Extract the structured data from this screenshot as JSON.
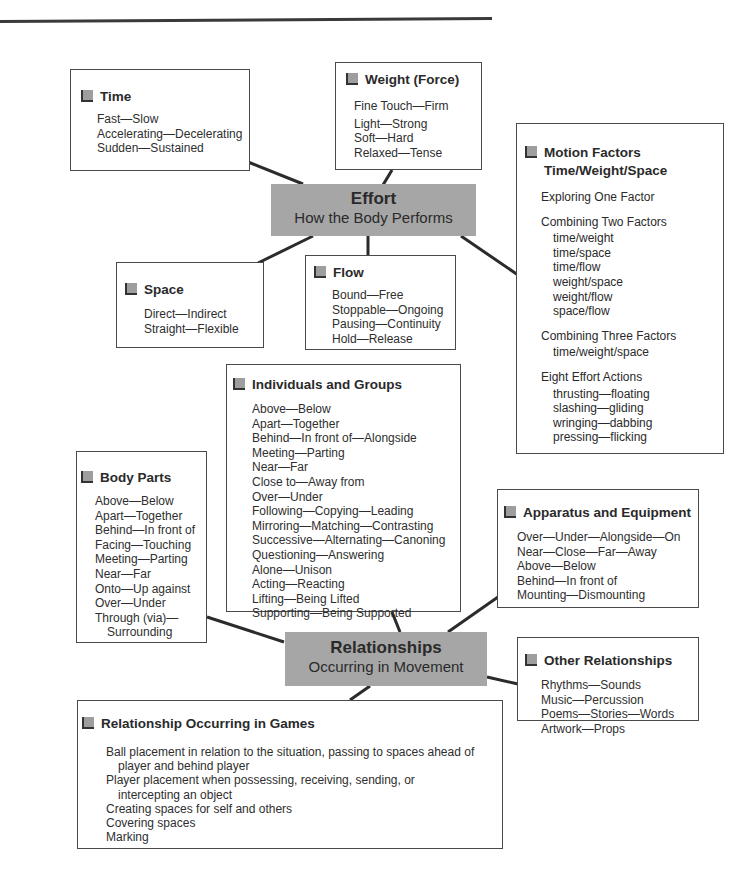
{
  "effort_hub": {
    "title": "Effort",
    "subtitle": "How the Body Performs"
  },
  "relationships_hub": {
    "title": "Relationships",
    "subtitle": "Occurring in Movement"
  },
  "time": {
    "title": "Time",
    "items": [
      "Fast—Slow",
      "Accelerating—Decelerating",
      "Sudden—Sustained"
    ]
  },
  "weight": {
    "title": "Weight (Force)",
    "items": [
      "Fine Touch—Firm",
      "Light—Strong",
      "Soft—Hard",
      "Relaxed—Tense"
    ]
  },
  "space": {
    "title": "Space",
    "items": [
      "Direct—Indirect",
      "Straight—Flexible"
    ]
  },
  "flow": {
    "title": "Flow",
    "items": [
      "Bound—Free",
      "Stoppable—Ongoing",
      "Pausing—Continuity",
      "Hold—Release"
    ]
  },
  "motion_factors": {
    "title_line1": "Motion Factors",
    "title_line2": "Time/Weight/Space",
    "groups": [
      {
        "heading": "Exploring One Factor",
        "items": []
      },
      {
        "heading": "Combining Two Factors",
        "items": [
          "time/weight",
          "time/space",
          "time/flow",
          "weight/space",
          "weight/flow",
          "space/flow"
        ]
      },
      {
        "heading": "Combining Three Factors",
        "items": [
          "time/weight/space"
        ]
      },
      {
        "heading": "Eight Effort Actions",
        "items": [
          "thrusting—floating",
          "slashing—gliding",
          "wringing—dabbing",
          "pressing—flicking"
        ]
      }
    ]
  },
  "individuals_groups": {
    "title": "Individuals and Groups",
    "items": [
      "Above—Below",
      "Apart—Together",
      "Behind—In front of—Alongside",
      "Meeting—Parting",
      "Near—Far",
      "Close to—Away from",
      "Over—Under",
      "Following—Copying—Leading",
      "Mirroring—Matching—Contrasting",
      "Successive—Alternating—Canoning",
      "Questioning—Answering",
      "Alone—Unison",
      "Acting—Reacting",
      "Lifting—Being Lifted",
      "Supporting—Being Supported"
    ]
  },
  "body_parts": {
    "title": "Body Parts",
    "items": [
      "Above—Below",
      "Apart—Together",
      "Behind—In front of",
      "Facing—Touching",
      "Meeting—Parting",
      "Near—Far",
      "Onto—Up against",
      "Over—Under",
      "Through (via)—"
    ],
    "continuation": "Surrounding"
  },
  "apparatus": {
    "title": "Apparatus and Equipment",
    "items": [
      "Over—Under—Alongside—On",
      "Near—Close—Far—Away",
      "Above—Below",
      "Behind—In front of",
      "Mounting—Dismounting"
    ]
  },
  "other_relationships": {
    "title": "Other Relationships",
    "items": [
      "Rhythms—Sounds",
      "Music—Percussion",
      "Poems—Stories—Words",
      "Artwork—Props"
    ]
  },
  "games": {
    "title": "Relationship Occurring in Games",
    "entries": [
      {
        "line": "Ball placement in relation to the situation, passing to spaces ahead of",
        "cont": "player and behind player"
      },
      {
        "line": "Player placement when possessing, receiving, sending, or",
        "cont": "intercepting an object"
      },
      {
        "line": "Creating spaces for self and others",
        "cont": ""
      },
      {
        "line": "Covering spaces",
        "cont": ""
      },
      {
        "line": "Marking",
        "cont": ""
      }
    ]
  },
  "colors": {
    "hub_fill": "#a6a6a6",
    "bullet_fill": "#9e9e9e",
    "line": "#2b2b2b",
    "border": "#4a4a4a"
  }
}
